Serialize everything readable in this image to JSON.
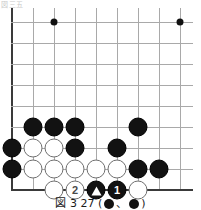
{
  "header": {
    "clipped_text": "図三五"
  },
  "figure": {
    "caption_left": "図 3  27 (",
    "caption_mid": "、",
    "caption_right": ")"
  },
  "board": {
    "cols": 9,
    "rows": 9,
    "x0": 12,
    "y0": 22,
    "step": 21,
    "colors": {
      "black": "#121212",
      "white": "#ffffff",
      "line": "#a9a9a9",
      "edge": "#3a3a3a"
    },
    "star_points": [
      {
        "col": 2,
        "row": 0
      },
      {
        "col": 8,
        "row": 0
      }
    ],
    "stones": [
      {
        "col": 1,
        "row": 5,
        "color": "black",
        "label": "",
        "mark": ""
      },
      {
        "col": 2,
        "row": 5,
        "color": "black",
        "label": "",
        "mark": ""
      },
      {
        "col": 3,
        "row": 5,
        "color": "black",
        "label": "",
        "mark": ""
      },
      {
        "col": 6,
        "row": 5,
        "color": "black",
        "label": "",
        "mark": ""
      },
      {
        "col": 0,
        "row": 6,
        "color": "black",
        "label": "",
        "mark": ""
      },
      {
        "col": 1,
        "row": 6,
        "color": "white",
        "label": "",
        "mark": ""
      },
      {
        "col": 2,
        "row": 6,
        "color": "white",
        "label": "",
        "mark": ""
      },
      {
        "col": 3,
        "row": 6,
        "color": "black",
        "label": "",
        "mark": ""
      },
      {
        "col": 5,
        "row": 6,
        "color": "black",
        "label": "",
        "mark": ""
      },
      {
        "col": 0,
        "row": 7,
        "color": "black",
        "label": "",
        "mark": ""
      },
      {
        "col": 1,
        "row": 7,
        "color": "white",
        "label": "",
        "mark": ""
      },
      {
        "col": 2,
        "row": 7,
        "color": "white",
        "label": "",
        "mark": ""
      },
      {
        "col": 3,
        "row": 7,
        "color": "white",
        "label": "",
        "mark": ""
      },
      {
        "col": 4,
        "row": 7,
        "color": "white",
        "label": "",
        "mark": ""
      },
      {
        "col": 5,
        "row": 7,
        "color": "white",
        "label": "",
        "mark": ""
      },
      {
        "col": 6,
        "row": 7,
        "color": "black",
        "label": "",
        "mark": ""
      },
      {
        "col": 7,
        "row": 7,
        "color": "black",
        "label": "",
        "mark": ""
      },
      {
        "col": 2,
        "row": 8,
        "color": "white",
        "label": "",
        "mark": ""
      },
      {
        "col": 3,
        "row": 8,
        "color": "white",
        "label": "2",
        "mark": ""
      },
      {
        "col": 4,
        "row": 8,
        "color": "black",
        "label": "",
        "mark": "triangle"
      },
      {
        "col": 5,
        "row": 8,
        "color": "black",
        "label": "1",
        "mark": ""
      },
      {
        "col": 6,
        "row": 8,
        "color": "white",
        "label": "",
        "mark": ""
      }
    ]
  }
}
